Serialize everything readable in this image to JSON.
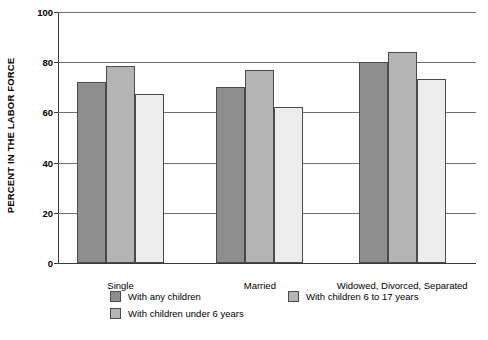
{
  "chart_data": {
    "type": "bar",
    "title": "",
    "xlabel": "",
    "ylabel": "PERCENT IN THE LABOR FORCE",
    "ylim": [
      0,
      100
    ],
    "yticks": [
      0,
      20,
      40,
      60,
      80,
      100
    ],
    "grid": true,
    "legend_position": "bottom",
    "categories": [
      "Single",
      "Married",
      "Widowed, Divorced, Separated"
    ],
    "series": [
      {
        "name": "With any children",
        "color": "#8e8e8e",
        "values": [
          72,
          70,
          80
        ]
      },
      {
        "name": "With children under 6 years",
        "color": "#b4b4b4",
        "values": [
          78.5,
          77,
          84
        ]
      },
      {
        "name": "With children 6 to 17 years",
        "color": "#ededed",
        "values": [
          67.5,
          62,
          73.5
        ]
      }
    ]
  },
  "axis": {
    "y_title": "PERCENT IN THE LABOR FORCE",
    "tick_labels": [
      "100",
      "80",
      "60",
      "40",
      "20",
      "0"
    ]
  },
  "legend": {
    "items": [
      {
        "label": "With any children",
        "color": "#8e8e8e"
      },
      {
        "label": "With children under 6 years",
        "color": "#b4b4b4"
      },
      {
        "label": "With children 6 to 17 years",
        "color": "#b4b4b4"
      }
    ]
  },
  "footer": {
    "cut_off_text": ""
  }
}
